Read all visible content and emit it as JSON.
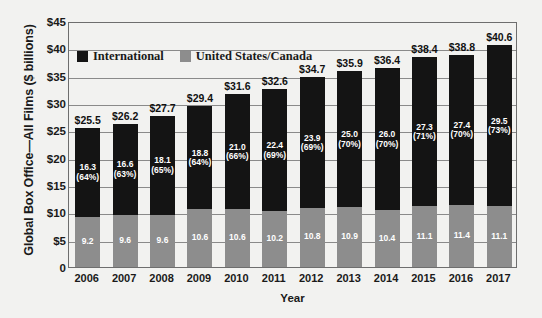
{
  "chart_data": {
    "type": "bar",
    "subtype": "stacked-bar",
    "title": "",
    "xlabel": "Year",
    "ylabel": "Global Box Office—All Films ($ billions)",
    "categories": [
      "2006",
      "2007",
      "2008",
      "2009",
      "2010",
      "2011",
      "2012",
      "2013",
      "2014",
      "2015",
      "2016",
      "2017"
    ],
    "ylim": [
      0,
      45
    ],
    "ytick_values": [
      0,
      5,
      10,
      15,
      20,
      25,
      30,
      35,
      40,
      45
    ],
    "ytick_labels": [
      "0",
      "$5",
      "$10",
      "$15",
      "$20",
      "$25",
      "$30",
      "$35",
      "$40",
      "$45"
    ],
    "grid": true,
    "legend_position": "upper-left-inside",
    "series": [
      {
        "name": "International",
        "color": "#141414",
        "values": [
          16.3,
          16.6,
          18.1,
          18.8,
          21.0,
          22.4,
          23.9,
          25.0,
          26.0,
          27.3,
          27.4,
          29.5
        ],
        "value_labels": [
          "16.3",
          "16.6",
          "18.1",
          "18.8",
          "21.0",
          "22.4",
          "23.9",
          "25.0",
          "26.0",
          "27.3",
          "27.4",
          "29.5"
        ],
        "percent_labels": [
          "(64%)",
          "(63%)",
          "(65%)",
          "(64%)",
          "(66%)",
          "(69%)",
          "(69%)",
          "(70%)",
          "(70%)",
          "(71%)",
          "(70%)",
          "(73%)"
        ]
      },
      {
        "name": "United States/Canada",
        "color": "#8d8d8d",
        "values": [
          9.2,
          9.6,
          9.6,
          10.6,
          10.6,
          10.2,
          10.8,
          10.9,
          10.4,
          11.1,
          11.4,
          11.1
        ],
        "value_labels": [
          "9.2",
          "9.6",
          "9.6",
          "10.6",
          "10.6",
          "10.2",
          "10.8",
          "10.9",
          "10.4",
          "11.1",
          "11.4",
          "11.1"
        ],
        "percent_labels": [
          "",
          "",
          "",
          "",
          "",
          "",
          "",
          "",
          "",
          "",
          "",
          ""
        ]
      }
    ],
    "totals": [
      25.5,
      26.2,
      27.7,
      29.4,
      31.6,
      32.6,
      34.7,
      35.9,
      36.4,
      38.4,
      38.8,
      40.6
    ],
    "total_labels": [
      "$25.5",
      "$26.2",
      "$27.7",
      "$29.4",
      "$31.6",
      "$32.6",
      "$34.7",
      "$35.9",
      "$36.4",
      "$38.4",
      "$38.8",
      "$40.6"
    ],
    "legend": [
      {
        "label": "International",
        "color": "#141414"
      },
      {
        "label": "United States/Canada",
        "color": "#8d8d8d"
      }
    ],
    "colors": {
      "background": "#f2f2f0",
      "plot_border": "#6e6e6e",
      "gridline": "#8a8a8a",
      "text": "#1a1a1a",
      "international": "#141414",
      "domestic": "#8d8d8d"
    }
  }
}
